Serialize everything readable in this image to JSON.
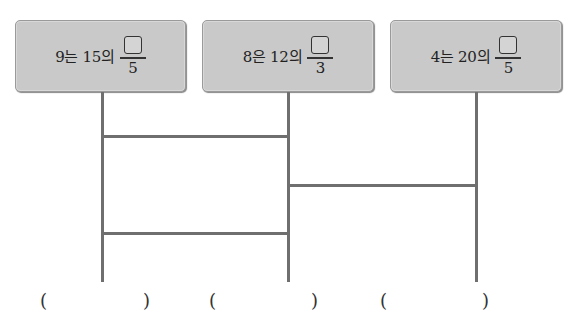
{
  "boxes": [
    {
      "text": "9는 15의",
      "numerator": "",
      "denominator": "5"
    },
    {
      "text": "8은 12의",
      "numerator": "",
      "denominator": "3"
    },
    {
      "text": "4는 20의",
      "numerator": "",
      "denominator": "5"
    }
  ],
  "ladder": {
    "verticals_x": [
      102,
      288,
      476
    ],
    "rungs": [
      {
        "from": 0,
        "to": 1,
        "y": 136
      },
      {
        "from": 1,
        "to": 2,
        "y": 185
      },
      {
        "from": 0,
        "to": 1,
        "y": 233
      }
    ]
  },
  "answers": [
    {
      "open": "(",
      "value": "",
      "close": ")"
    },
    {
      "open": "(",
      "value": "",
      "close": ")"
    },
    {
      "open": "(",
      "value": "",
      "close": ")"
    }
  ],
  "colors": {
    "box_fill": "#c9c9c9",
    "line": "#6f6f6f"
  }
}
